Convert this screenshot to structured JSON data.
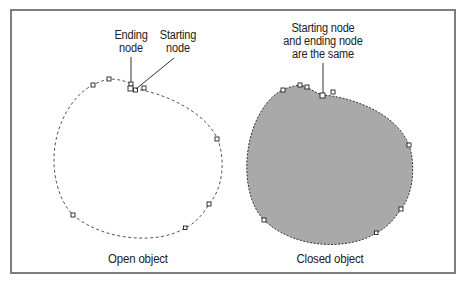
{
  "figure": {
    "left_panel": {
      "callout_ending": "Ending\nnode",
      "callout_ending_l1": "Ending",
      "callout_ending_l2": "node",
      "callout_starting_l1": "Starting",
      "callout_starting_l2": "node",
      "caption": "Open object",
      "fill": "none",
      "stroke": "#555555"
    },
    "right_panel": {
      "callout_l1": "Starting node",
      "callout_l2": "and ending node",
      "callout_l3": "are the same",
      "caption": "Closed object",
      "fill": "#a9a9a9",
      "stroke": "#444444"
    },
    "frame_color": "#7d7d7d"
  }
}
